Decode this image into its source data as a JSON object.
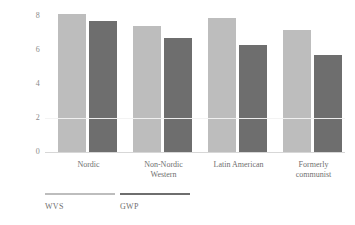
{
  "chart_data": {
    "type": "bar",
    "title": "",
    "subtitle": "",
    "xlabel": "",
    "ylabel": "",
    "ylim": [
      0,
      8.6
    ],
    "yticks": [
      "0",
      "2",
      "4",
      "6",
      "8"
    ],
    "ytick_values": [
      0,
      2,
      4,
      6,
      8
    ],
    "grid": false,
    "legend_position": "bottom-left",
    "categories": [
      "Nordic",
      "Non-Nordic Western",
      "Latin American",
      "Formerly communist"
    ],
    "category_lines": [
      [
        "Nordic"
      ],
      [
        "Non-Nordic",
        "Western"
      ],
      [
        "Latin American"
      ],
      [
        "Formerly",
        "communist"
      ]
    ],
    "series": [
      {
        "name": "WVS",
        "color": "#bdbdbd",
        "values": [
          8.1,
          7.4,
          7.9,
          7.2
        ]
      },
      {
        "name": "GWP",
        "color": "#6e6e6e",
        "values": [
          7.7,
          6.7,
          6.3,
          5.7
        ]
      }
    ]
  },
  "legend": {
    "items": [
      {
        "label": "WVS",
        "color": "#bdbdbd"
      },
      {
        "label": "GWP",
        "color": "#6e6e6e"
      }
    ]
  },
  "colors": {
    "background": "#ffffff",
    "axis": "#d7d7d7",
    "tick_text": "#8a8a8a",
    "label_text": "#6f6f6f",
    "series_light": "#bdbdbd",
    "series_dark": "#6e6e6e",
    "gridline_over_bars": "#f2f2f2"
  }
}
